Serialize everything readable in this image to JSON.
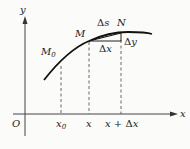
{
  "diagram": {
    "axes": {
      "x_label": "x",
      "y_label": "y",
      "origin_label": "O"
    },
    "points": {
      "m0": {
        "name": "M",
        "subscript": "0"
      },
      "m": {
        "name": "M"
      },
      "n": {
        "name": "N"
      }
    },
    "increments": {
      "ds": {
        "delta": "Δ",
        "var": "s"
      },
      "dx": {
        "delta": "Δ",
        "var": "x"
      },
      "dy": {
        "delta": "Δ",
        "var": "y"
      }
    },
    "ticks": {
      "x0": {
        "name": "x",
        "subscript": "0"
      },
      "x": {
        "name": "x"
      },
      "x_plus_dx": {
        "name": "x",
        "op": " + ",
        "delta": "Δ",
        "var": "x"
      }
    }
  }
}
